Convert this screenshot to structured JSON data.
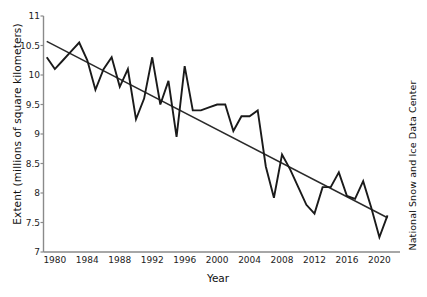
{
  "chart_data": {
    "type": "line",
    "title": "",
    "xlabel": "Year",
    "ylabel": "Extent (millions of square kilometers)",
    "right_label": "National Snow and Ice Data Center",
    "xlim": [
      1978.6,
      2021.8
    ],
    "ylim": [
      7,
      11
    ],
    "yticks": [
      7,
      7.5,
      8,
      8.5,
      9,
      9.5,
      10,
      10.5,
      11
    ],
    "ytick_labels": [
      "7",
      "7.5",
      "8",
      "8.5",
      "9",
      "9.5",
      "10",
      "10.5",
      "11"
    ],
    "xticks": [
      1980,
      1984,
      1988,
      1992,
      1996,
      2000,
      2004,
      2008,
      2012,
      2016,
      2020
    ],
    "xtick_labels": [
      "1980",
      "1984",
      "1988",
      "1992",
      "1996",
      "2000",
      "2004",
      "2008",
      "2012",
      "2016",
      "2020"
    ],
    "grid": false,
    "legend": "none",
    "series": [
      {
        "name": "September Arctic sea ice extent",
        "color": "#1a1a1a",
        "x": [
          1979,
          1980,
          1981,
          1982,
          1983,
          1984,
          1985,
          1986,
          1987,
          1988,
          1989,
          1990,
          1991,
          1992,
          1993,
          1994,
          1995,
          1996,
          1997,
          1998,
          1999,
          2000,
          2001,
          2002,
          2003,
          2004,
          2005,
          2006,
          2007,
          2008,
          2009,
          2010,
          2011,
          2012,
          2013,
          2014,
          2015,
          2016,
          2017,
          2018,
          2019,
          2020,
          2021
        ],
        "values": [
          10.3,
          10.1,
          10.25,
          10.4,
          10.55,
          10.25,
          9.75,
          10.1,
          10.3,
          9.8,
          10.1,
          9.25,
          9.6,
          10.3,
          9.5,
          9.9,
          8.95,
          10.15,
          9.4,
          9.4,
          9.45,
          9.5,
          9.5,
          9.05,
          9.3,
          9.3,
          9.4,
          8.45,
          7.92,
          8.65,
          8.4,
          8.1,
          7.8,
          7.65,
          8.1,
          8.1,
          8.35,
          7.95,
          7.9,
          8.2,
          7.75,
          7.25,
          7.62
        ]
      },
      {
        "name": "Linear trend line",
        "color": "#2a2a2a",
        "x": [
          1979,
          2021
        ],
        "values": [
          10.57,
          7.58
        ]
      }
    ]
  }
}
